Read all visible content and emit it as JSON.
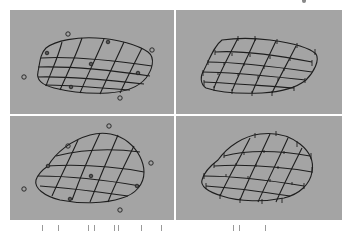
{
  "figure": {
    "background": "#a4a4a4",
    "line_color": "#1e1e1e",
    "panels": [
      {
        "id": "top-left",
        "description": "Bezier surface patch with detached control-point circles (uniform)",
        "control_points_off": [
          [
            68,
            34
          ],
          [
            152,
            50
          ],
          [
            24,
            77
          ],
          [
            120,
            98
          ]
        ],
        "control_points_on": [
          [
            108,
            42
          ],
          [
            47,
            53
          ],
          [
            91,
            64
          ],
          [
            138,
            73
          ],
          [
            71,
            87
          ]
        ]
      },
      {
        "id": "top-right",
        "description": "Surface patch with tick-mark knots on grid intersections (uniform)"
      },
      {
        "id": "bottom-left",
        "description": "Deformed surface patch with control-point circles",
        "control_points_off": [
          [
            109,
            126
          ],
          [
            68,
            146
          ],
          [
            151,
            163
          ],
          [
            24,
            189
          ],
          [
            120,
            210
          ]
        ],
        "control_points_on": [
          [
            48,
            166
          ],
          [
            91,
            176
          ],
          [
            137,
            186
          ],
          [
            70,
            199
          ]
        ]
      },
      {
        "id": "bottom-right",
        "description": "Deformed surface patch with tick-mark knots"
      }
    ]
  },
  "caption": {
    "visible_text": ""
  }
}
